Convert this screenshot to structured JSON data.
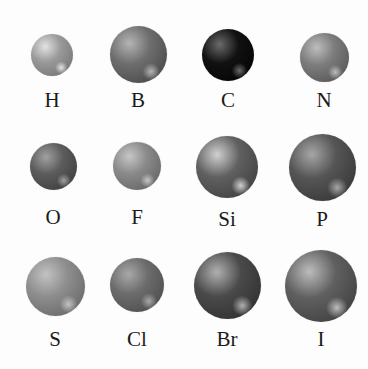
{
  "diagram": {
    "title": "",
    "atoms": [
      {
        "symbol": "H",
        "cx": 52,
        "cy": 55,
        "d": 42,
        "base": "#9a9a9a",
        "light": "#e2e2e2",
        "dark": "#6a6a6a",
        "label_y": 90
      },
      {
        "symbol": "B",
        "cx": 138,
        "cy": 54,
        "d": 57,
        "base": "#6e6e6e",
        "light": "#b4b4b4",
        "dark": "#3e3e3e",
        "label_y": 90
      },
      {
        "symbol": "C",
        "cx": 228,
        "cy": 55,
        "d": 52,
        "base": "#111111",
        "light": "#6a6a6a",
        "dark": "#000000",
        "label_y": 90
      },
      {
        "symbol": "N",
        "cx": 324,
        "cy": 57,
        "d": 49,
        "base": "#7c7c7c",
        "light": "#bdbdbd",
        "dark": "#4c4c4c",
        "label_y": 90
      },
      {
        "symbol": "O",
        "cx": 53,
        "cy": 166,
        "d": 47,
        "base": "#5c5c5c",
        "light": "#a0a0a0",
        "dark": "#353535",
        "label_y": 207
      },
      {
        "symbol": "F",
        "cx": 137,
        "cy": 166,
        "d": 48,
        "base": "#8a8a8a",
        "light": "#c6c6c6",
        "dark": "#5a5a5a",
        "label_y": 207
      },
      {
        "symbol": "Si",
        "cx": 227,
        "cy": 167,
        "d": 62,
        "base": "#606060",
        "light": "#d0d0d0",
        "dark": "#363636",
        "label_y": 209
      },
      {
        "symbol": "P",
        "cx": 322,
        "cy": 167,
        "d": 67,
        "base": "#555555",
        "light": "#a6a6a6",
        "dark": "#2e2e2e",
        "label_y": 209
      },
      {
        "symbol": "S",
        "cx": 55,
        "cy": 286,
        "d": 59,
        "base": "#8e8e8e",
        "light": "#c2c2c2",
        "dark": "#5e5e5e",
        "label_y": 329
      },
      {
        "symbol": "Cl",
        "cx": 137,
        "cy": 285,
        "d": 54,
        "base": "#6c6c6c",
        "light": "#a8a8a8",
        "dark": "#444444",
        "label_y": 329
      },
      {
        "symbol": "Br",
        "cx": 227,
        "cy": 285,
        "d": 67,
        "base": "#4a4a4a",
        "light": "#b0b0b0",
        "dark": "#282828",
        "label_y": 329
      },
      {
        "symbol": "I",
        "cx": 321,
        "cy": 286,
        "d": 72,
        "base": "#606060",
        "light": "#bcbcbc",
        "dark": "#363636",
        "label_y": 329
      }
    ]
  }
}
